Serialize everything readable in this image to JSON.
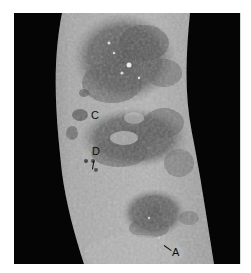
{
  "image": {
    "description": "Grayscale clinical photograph of a limb with extensive crusted, plaque-like skin lesions against a black background",
    "background_color": "#050505",
    "skin_tone_light": "#b8b8b8",
    "skin_tone_mid": "#8a8a8a",
    "lesion_dark": "#4a4a4a",
    "highlight": "#e8e8e8"
  },
  "labels": {
    "a": "A",
    "b": "B",
    "c": "C",
    "d": "D"
  }
}
